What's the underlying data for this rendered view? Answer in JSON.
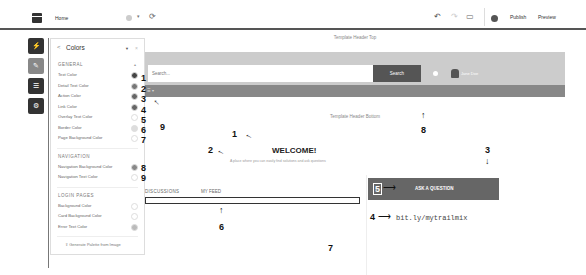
{
  "topbar": {
    "page_name": "Home",
    "actions": {
      "publish": "Publish",
      "preview": "Preview"
    }
  },
  "rail": {
    "items": [
      {
        "name": "components",
        "icon": "lightning-icon",
        "glyph": "⚡"
      },
      {
        "name": "theme",
        "icon": "pencil-icon",
        "glyph": "✎"
      },
      {
        "name": "pages",
        "icon": "page-icon",
        "glyph": "☰"
      },
      {
        "name": "settings",
        "icon": "gear-icon",
        "glyph": "⚙"
      }
    ]
  },
  "panel": {
    "back": "<",
    "title": "Colors",
    "sections": {
      "general": "GENERAL",
      "navigation": "NAVIGATION",
      "login": "LOGIN PAGES"
    },
    "general": [
      {
        "label": "Text Color",
        "color": "#444444"
      },
      {
        "label": "Detail Text Color",
        "color": "#777777"
      },
      {
        "label": "Action Color",
        "color": "#666666"
      },
      {
        "label": "Link Color",
        "color": "#666666"
      },
      {
        "label": "Overlay Text Color",
        "color": "#ffffff"
      },
      {
        "label": "Border Color",
        "color": "#dddddd"
      },
      {
        "label": "Page Background Color",
        "color": "#ffffff"
      }
    ],
    "navigation": [
      {
        "label": "Navigation Background Color",
        "color": "#888888"
      },
      {
        "label": "Navigation Text Color",
        "color": "#ffffff"
      }
    ],
    "login": [
      {
        "label": "Background Color",
        "color": "#ffffff"
      },
      {
        "label": "Card Background Color",
        "color": "#ffffff"
      },
      {
        "label": "Error Text Color",
        "color": "#bbbbbb"
      }
    ],
    "generate": "Generate Palette from Image"
  },
  "canvas": {
    "header_top": "Template Header Top",
    "search_placeholder": "Search...",
    "search_button": "Search",
    "user_name": "Jane Doe",
    "header_bottom": "Template Header Bottom",
    "welcome": "WELCOME!",
    "tagline": "A place where you can easily find solutions and ask questions",
    "tabs": [
      "DISCUSSIONS",
      "MY FEED"
    ],
    "ask_button": "ASK A QUESTION",
    "link": "bit.ly/mytrailmix"
  },
  "annotations": [
    "1",
    "2",
    "3",
    "4",
    "5",
    "6",
    "7",
    "8",
    "9"
  ]
}
